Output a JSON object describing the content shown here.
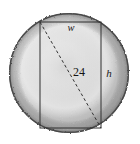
{
  "figure": {
    "canvas": {
      "width": 140,
      "height": 144,
      "background": "#ffffff"
    },
    "circle": {
      "name": "shaded-circle",
      "center_x": 69,
      "center_y": 73,
      "radius": 60,
      "fill_light": "#f2f2f2",
      "fill_mid": "#c9c9c9",
      "fill_dark": "#9a9a9a",
      "edge_color": "#4a4a4a",
      "edge_width": 1.4,
      "texture": "rough speckled rim"
    },
    "rectangle": {
      "name": "inscribed-rectangle",
      "left": 40,
      "top": 22,
      "right": 101,
      "bottom": 128,
      "width": 61,
      "height": 106,
      "stroke": "#2e2e2e",
      "stroke_width": 1,
      "fill": "none"
    },
    "diagonal": {
      "name": "diagonal-diameter",
      "x1": 40,
      "y1": 22,
      "x2": 101,
      "y2": 128,
      "stroke": "#333333",
      "stroke_width": 1,
      "dash": "3 2.5"
    },
    "labels": {
      "width_label": {
        "text": "w",
        "x": 71,
        "y": 31,
        "style": "italic"
      },
      "height_label": {
        "text": "h",
        "x": 109,
        "y": 77,
        "style": "italic"
      },
      "diagonal_label": {
        "text": "24",
        "x": 79,
        "y": 75,
        "style": "normal"
      }
    }
  }
}
